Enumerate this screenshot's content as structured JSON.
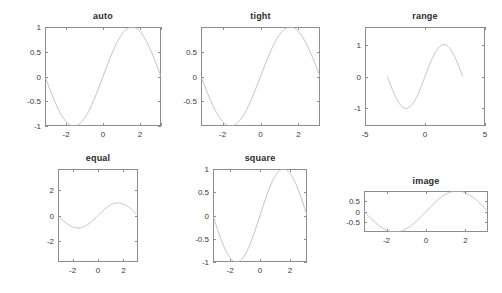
{
  "figure": {
    "background": "#ffffff",
    "line_color": "#b9b9b9",
    "axis_color": "#8d8d8d",
    "text_color": "#3a3a3a",
    "title_color": "#2b2b2b"
  },
  "chart_data": [
    {
      "type": "line",
      "title": "auto",
      "function": "sin(x)",
      "x": [
        -3.1416,
        -2.9845,
        -2.8274,
        -2.6704,
        -2.5133,
        -2.3562,
        -2.1991,
        -2.042,
        -1.885,
        -1.7279,
        -1.5708,
        -1.4137,
        -1.2566,
        -1.0996,
        -0.9425,
        -0.7854,
        -0.6283,
        -0.4712,
        -0.3142,
        -0.1571,
        0,
        0.1571,
        0.3142,
        0.4712,
        0.6283,
        0.7854,
        0.9425,
        1.0996,
        1.2566,
        1.4137,
        1.5708,
        1.7279,
        1.885,
        2.042,
        2.1991,
        2.3562,
        2.5133,
        2.6704,
        2.8274,
        2.9845,
        3.1416
      ],
      "y": [
        0,
        -0.1564,
        -0.309,
        -0.454,
        -0.5878,
        -0.7071,
        -0.809,
        -0.891,
        -0.9511,
        -0.9877,
        -1,
        -0.9877,
        -0.9511,
        -0.891,
        -0.809,
        -0.7071,
        -0.5878,
        -0.454,
        -0.309,
        -0.1564,
        0,
        0.1564,
        0.309,
        0.454,
        0.5878,
        0.7071,
        0.809,
        0.891,
        0.9511,
        0.9877,
        1,
        0.9877,
        0.9511,
        0.891,
        0.809,
        0.7071,
        0.5878,
        0.454,
        0.309,
        0.1564,
        0
      ],
      "xlim": [
        -3.1416,
        3.1416
      ],
      "ylim": [
        -1,
        1
      ],
      "xticks": [
        -2,
        0,
        2
      ],
      "xticklabels": [
        "-2",
        "0",
        "2"
      ],
      "yticks": [
        -1,
        -0.5,
        0,
        0.5,
        1
      ],
      "yticklabels": [
        "-1",
        "-0.5",
        "0",
        "0.5",
        "1"
      ],
      "xminorticks": [
        -3.1416,
        -2,
        0,
        2,
        3.1416
      ],
      "yminorticks": [
        -1,
        -0.5,
        0,
        0.5,
        1
      ],
      "xlabel": "",
      "ylabel": "",
      "grid": false,
      "legend": false,
      "axis_mode": "auto"
    },
    {
      "type": "line",
      "title": "tight",
      "function": "sin(x)",
      "xlim": [
        -3.1416,
        3.1416
      ],
      "ylim": [
        -1,
        1
      ],
      "xticks": [
        -2,
        0,
        2
      ],
      "xticklabels": [
        "-2",
        "0",
        "2"
      ],
      "yticks": [
        -0.5,
        0,
        0.5
      ],
      "yticklabels": [
        "-0.5",
        "0",
        "0.5"
      ],
      "xminorticks": [
        -2,
        0,
        2
      ],
      "yminorticks": [
        -0.5,
        0,
        0.5
      ],
      "xlabel": "",
      "ylabel": "",
      "grid": false,
      "legend": false,
      "axis_mode": "tight"
    },
    {
      "type": "line",
      "title": "range",
      "function": "sin(x)",
      "xlim": [
        -5,
        5
      ],
      "ylim": [
        -1.55,
        1.55
      ],
      "xticks": [
        -5,
        0,
        5
      ],
      "xticklabels": [
        "-5",
        "0",
        "5"
      ],
      "yticks": [
        -1,
        0,
        1
      ],
      "yticklabels": [
        "-1",
        "0",
        "1"
      ],
      "xminorticks": [
        -5,
        0,
        5
      ],
      "yminorticks": [
        -1,
        0,
        1
      ],
      "xlabel": "",
      "ylabel": "",
      "grid": false,
      "legend": false,
      "axis_mode": "range"
    },
    {
      "type": "line",
      "title": "equal",
      "function": "sin(x)",
      "xlim": [
        -3.1416,
        3.1416
      ],
      "ylim": [
        -3.7,
        3.7
      ],
      "xticks": [
        -2,
        0,
        2
      ],
      "xticklabels": [
        "-2",
        "0",
        "2"
      ],
      "yticks": [
        -2,
        0,
        2
      ],
      "yticklabels": [
        "-2",
        "0",
        "2"
      ],
      "xminorticks": [
        -2,
        0,
        2
      ],
      "yminorticks": [
        -2,
        0,
        2
      ],
      "xlabel": "",
      "ylabel": "",
      "grid": false,
      "legend": false,
      "axis_mode": "equal"
    },
    {
      "type": "line",
      "title": "square",
      "function": "sin(x)",
      "xlim": [
        -3.1416,
        3.1416
      ],
      "ylim": [
        -1,
        1
      ],
      "xticks": [
        -2,
        0,
        2
      ],
      "xticklabels": [
        "-2",
        "0",
        "2"
      ],
      "yticks": [
        -1,
        -0.5,
        0,
        0.5,
        1
      ],
      "yticklabels": [
        "-1",
        "-0.5",
        "0",
        "0.5",
        "1"
      ],
      "xminorticks": [
        -2,
        0,
        2
      ],
      "yminorticks": [
        -1,
        -0.5,
        0,
        0.5,
        1
      ],
      "xlabel": "",
      "ylabel": "",
      "grid": false,
      "legend": false,
      "axis_mode": "square"
    },
    {
      "type": "line",
      "title": "image",
      "function": "sin(x)",
      "xlim": [
        -3.1416,
        3.1416
      ],
      "ylim": [
        -1,
        1
      ],
      "xticks": [
        -2,
        0,
        2
      ],
      "xticklabels": [
        "-2",
        "0",
        "2"
      ],
      "yticks": [
        -0.5,
        0,
        0.5
      ],
      "yticklabels": [
        "-0.5",
        "0",
        "0.5"
      ],
      "xminorticks": [
        -2,
        0,
        2
      ],
      "yminorticks": [
        -0.5,
        0,
        0.5
      ],
      "xlabel": "",
      "ylabel": "",
      "grid": false,
      "legend": false,
      "axis_mode": "image"
    }
  ],
  "layout": {
    "panels": [
      {
        "name": "auto",
        "axes": {
          "left": 45,
          "top": 27,
          "width": 116,
          "height": 99
        },
        "title_top": 11
      },
      {
        "name": "tight",
        "axes": {
          "left": 201,
          "top": 27,
          "width": 119,
          "height": 99
        },
        "title_top": 11
      },
      {
        "name": "range",
        "axes": {
          "left": 365,
          "top": 27,
          "width": 120,
          "height": 99
        },
        "title_top": 11
      },
      {
        "name": "equal",
        "axes": {
          "left": 58,
          "top": 169,
          "width": 80,
          "height": 93
        },
        "title_top": 153
      },
      {
        "name": "square",
        "axes": {
          "left": 213,
          "top": 169,
          "width": 94,
          "height": 93
        },
        "title_top": 153
      },
      {
        "name": "image",
        "axes": {
          "left": 364,
          "top": 191,
          "width": 124,
          "height": 41
        },
        "title_top": 176
      }
    ]
  }
}
